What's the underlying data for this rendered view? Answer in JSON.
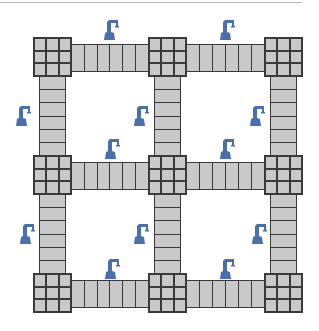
{
  "diagram": {
    "colors": {
      "tile_fill": "#c9c9c9",
      "tile_line": "#3a3a3a",
      "robot": "#4a6fad",
      "top_rule": "#b9b9b9"
    },
    "grid": {
      "rows": 3,
      "cols": 3
    },
    "nodes": [
      {
        "row": 0,
        "col": 0,
        "x": 33,
        "y": 37
      },
      {
        "row": 0,
        "col": 1,
        "x": 148,
        "y": 37
      },
      {
        "row": 0,
        "col": 2,
        "x": 264,
        "y": 37
      },
      {
        "row": 1,
        "col": 0,
        "x": 33,
        "y": 155
      },
      {
        "row": 1,
        "col": 1,
        "x": 148,
        "y": 155
      },
      {
        "row": 1,
        "col": 2,
        "x": 264,
        "y": 155
      },
      {
        "row": 2,
        "col": 0,
        "x": 33,
        "y": 273
      },
      {
        "row": 2,
        "col": 1,
        "x": 148,
        "y": 273
      },
      {
        "row": 2,
        "col": 2,
        "x": 264,
        "y": 273
      }
    ],
    "horizontal_bridges": [
      {
        "from": "0,0",
        "to": "0,1",
        "segments": 6
      },
      {
        "from": "0,1",
        "to": "0,2",
        "segments": 6
      },
      {
        "from": "1,0",
        "to": "1,1",
        "segments": 6
      },
      {
        "from": "1,1",
        "to": "1,2",
        "segments": 6
      },
      {
        "from": "2,0",
        "to": "2,1",
        "segments": 6
      },
      {
        "from": "2,1",
        "to": "2,2",
        "segments": 6
      }
    ],
    "vertical_bridges": [
      {
        "from": "0,0",
        "to": "1,0",
        "segments": 6
      },
      {
        "from": "0,1",
        "to": "1,1",
        "segments": 6
      },
      {
        "from": "0,2",
        "to": "1,2",
        "segments": 6
      },
      {
        "from": "1,0",
        "to": "2,0",
        "segments": 6
      },
      {
        "from": "1,1",
        "to": "2,1",
        "segments": 6
      },
      {
        "from": "1,2",
        "to": "2,2",
        "segments": 6
      }
    ],
    "robots": [
      {
        "icon": "robot-arm-icon",
        "x": 103,
        "y": 18
      },
      {
        "icon": "robot-arm-icon",
        "x": 219,
        "y": 18
      },
      {
        "icon": "robot-arm-icon",
        "x": 15,
        "y": 104
      },
      {
        "icon": "robot-arm-icon",
        "x": 133,
        "y": 104
      },
      {
        "icon": "robot-arm-icon",
        "x": 249,
        "y": 104
      },
      {
        "icon": "robot-arm-icon",
        "x": 104,
        "y": 137
      },
      {
        "icon": "robot-arm-icon",
        "x": 219,
        "y": 137
      },
      {
        "icon": "robot-arm-icon",
        "x": 19,
        "y": 222
      },
      {
        "icon": "robot-arm-icon",
        "x": 133,
        "y": 222
      },
      {
        "icon": "robot-arm-icon",
        "x": 251,
        "y": 222
      },
      {
        "icon": "robot-arm-icon",
        "x": 104,
        "y": 257
      },
      {
        "icon": "robot-arm-icon",
        "x": 219,
        "y": 257
      }
    ]
  }
}
